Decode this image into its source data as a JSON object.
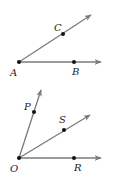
{
  "figures": [
    {
      "name": "angle-BAC",
      "vertex": {
        "label": "A",
        "x": 19,
        "y": 62
      },
      "rays": [
        {
          "through": "B",
          "point": {
            "x": 74,
            "y": 62
          },
          "tip": {
            "x": 101,
            "y": 62
          }
        },
        {
          "through": "C",
          "point": {
            "x": 63,
            "y": 34
          },
          "tip": {
            "x": 91,
            "y": 15
          }
        }
      ],
      "labels": {
        "A": "A",
        "B": "B",
        "C": "C"
      }
    },
    {
      "name": "angles-at-O",
      "vertex": {
        "label": "O",
        "x": 19,
        "y": 158
      },
      "rays": [
        {
          "through": "P",
          "point": {
            "x": 34,
            "y": 112
          },
          "tip": {
            "x": 41,
            "y": 90
          }
        },
        {
          "through": "S",
          "point": {
            "x": 64,
            "y": 130
          },
          "tip": {
            "x": 90,
            "y": 115
          }
        },
        {
          "through": "R",
          "point": {
            "x": 74,
            "y": 158
          },
          "tip": {
            "x": 101,
            "y": 158
          }
        }
      ],
      "labels": {
        "O": "O",
        "P": "P",
        "S": "S",
        "R": "R"
      }
    }
  ],
  "colors": {
    "ray": "#7a7a7a",
    "dot": "#111111",
    "label": "#222222"
  }
}
